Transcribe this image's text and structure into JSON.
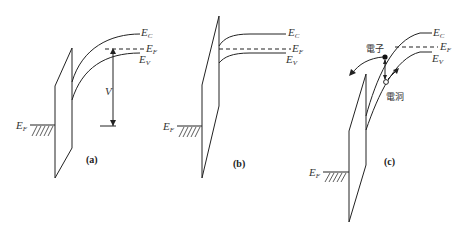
{
  "panels": [
    {
      "id": "a",
      "caption": "(a)",
      "labels": {
        "ec": "E",
        "ec_sub": "C",
        "ef": "E",
        "ef_sub": "F",
        "ev": "E",
        "ev_sub": "V",
        "ef_metal": "E",
        "ef_metal_sub": "F",
        "voltage": "V"
      }
    },
    {
      "id": "b",
      "caption": "(b)",
      "labels": {
        "ec": "E",
        "ec_sub": "C",
        "ef": "E",
        "ef_sub": "F",
        "ev": "E",
        "ev_sub": "V",
        "ef_metal": "E",
        "ef_metal_sub": "F"
      }
    },
    {
      "id": "c",
      "caption": "(c)",
      "labels": {
        "ec": "E",
        "ec_sub": "C",
        "ef": "E",
        "ef_sub": "F",
        "ev": "E",
        "ev_sub": "V",
        "ef_metal": "E",
        "ef_metal_sub": "F",
        "electron": "電子",
        "hole": "電洞"
      }
    }
  ]
}
